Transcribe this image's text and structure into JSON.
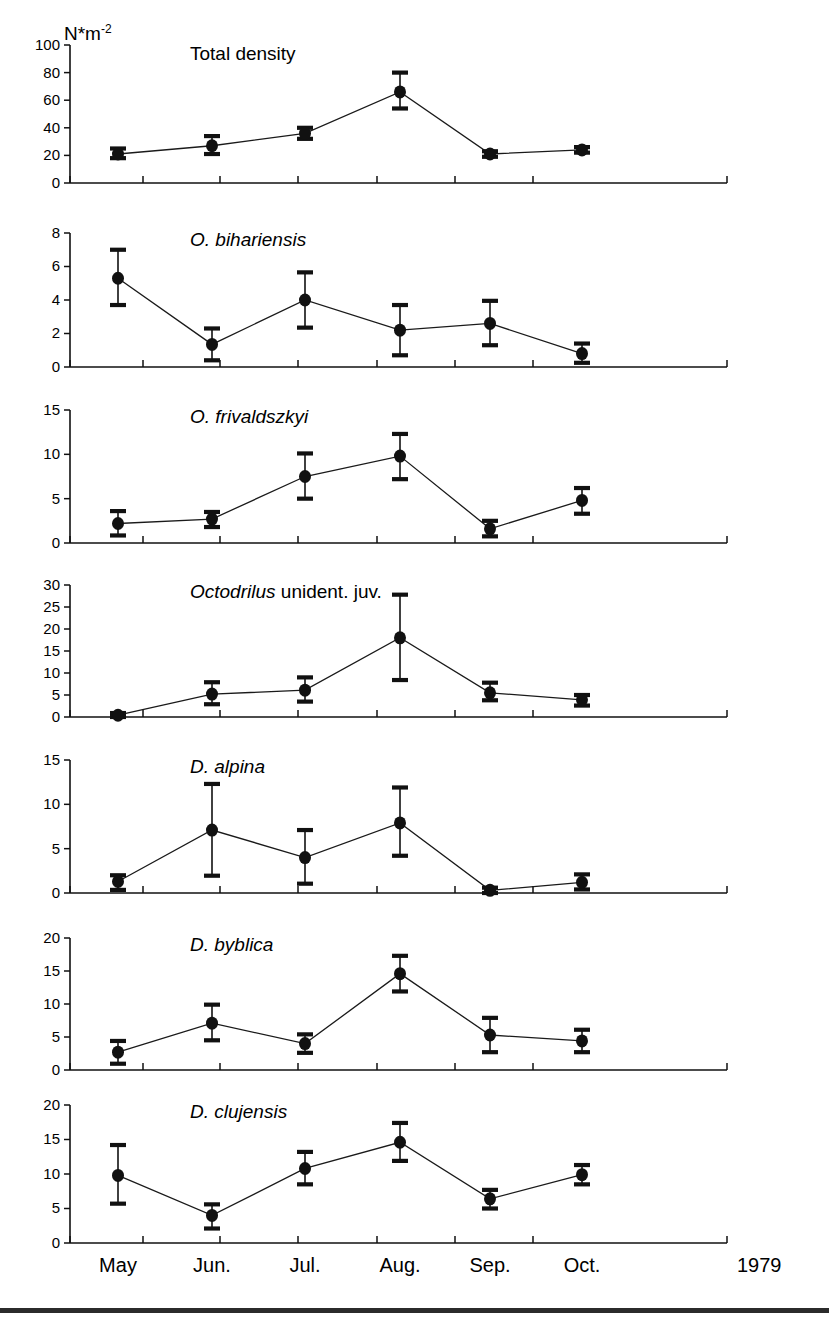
{
  "figure": {
    "unit_label": "N*m",
    "unit_exponent": "-2",
    "year": "1979",
    "x_categories": [
      "May",
      "Jun.",
      "Jul.",
      "Aug.",
      "Sep.",
      "Oct."
    ]
  },
  "chart_data": {
    "type": "line",
    "title": "",
    "xlabel": "",
    "ylabel": "N*m-2",
    "grid": false,
    "legend": "none",
    "x": [
      "May",
      "Jun.",
      "Jul.",
      "Aug.",
      "Sep.",
      "Oct."
    ],
    "panels": [
      {
        "title": "Total density",
        "title_italic": "",
        "title_plain": "Total density",
        "ylim": [
          0,
          100
        ],
        "yticks": [
          0,
          20,
          40,
          60,
          80,
          100
        ],
        "values": [
          21,
          27,
          36,
          66,
          21,
          24
        ],
        "err_low": [
          18,
          21,
          32,
          54,
          19,
          22
        ],
        "err_high": [
          25,
          34,
          40,
          80,
          23,
          26
        ]
      },
      {
        "title": "O. bihariensis",
        "title_italic": "O. bihariensis",
        "title_plain": "",
        "ylim": [
          0,
          8
        ],
        "yticks": [
          0,
          2,
          4,
          6,
          8
        ],
        "values": [
          5.3,
          1.35,
          4.0,
          2.2,
          2.6,
          0.8
        ],
        "err_low": [
          3.7,
          0.4,
          2.35,
          0.7,
          1.3,
          0.25
        ],
        "err_high": [
          7.0,
          2.3,
          5.65,
          3.7,
          3.95,
          1.4
        ]
      },
      {
        "title": "O. frivaldszkyi",
        "title_italic": "O. frivaldszkyi",
        "title_plain": "",
        "ylim": [
          0,
          15
        ],
        "yticks": [
          0,
          5,
          10,
          15
        ],
        "values": [
          2.2,
          2.7,
          7.5,
          9.8,
          1.6,
          4.8
        ],
        "err_low": [
          0.85,
          1.8,
          5.0,
          7.2,
          0.75,
          3.3
        ],
        "err_high": [
          3.6,
          3.5,
          10.1,
          12.3,
          2.5,
          6.2
        ]
      },
      {
        "title": "Octodrilus unident. juv.",
        "title_italic": "Octodrilus",
        "title_plain": " unident. juv.",
        "ylim": [
          0,
          30
        ],
        "yticks": [
          0,
          5,
          10,
          15,
          20,
          25,
          30
        ],
        "values": [
          0.4,
          5.2,
          6.1,
          18.0,
          5.5,
          3.9
        ],
        "err_low": [
          0.0,
          2.9,
          3.5,
          8.4,
          3.8,
          2.6
        ],
        "err_high": [
          0.9,
          7.9,
          9.0,
          27.8,
          7.8,
          5.0
        ]
      },
      {
        "title": "D. alpina",
        "title_italic": "D. alpina",
        "title_plain": "",
        "ylim": [
          0,
          15
        ],
        "yticks": [
          0,
          5,
          10,
          15
        ],
        "values": [
          1.3,
          7.1,
          4.0,
          7.9,
          0.3,
          1.2
        ],
        "err_low": [
          0.35,
          1.95,
          1.05,
          4.2,
          0.0,
          0.4
        ],
        "err_high": [
          2.0,
          12.3,
          7.1,
          11.9,
          0.6,
          2.1
        ]
      },
      {
        "title": "D. byblica",
        "title_italic": "D. byblica",
        "title_plain": "",
        "ylim": [
          0,
          20
        ],
        "yticks": [
          0,
          5,
          10,
          15,
          20
        ],
        "values": [
          2.7,
          7.1,
          4.0,
          14.6,
          5.3,
          4.4
        ],
        "err_low": [
          0.95,
          4.5,
          2.6,
          11.9,
          2.7,
          2.7
        ],
        "err_high": [
          4.4,
          9.9,
          5.4,
          17.3,
          7.9,
          6.1
        ]
      },
      {
        "title": "D. clujensis",
        "title_italic": "D. clujensis",
        "title_plain": "",
        "ylim": [
          0,
          20
        ],
        "yticks": [
          0,
          5,
          10,
          15,
          20
        ],
        "values": [
          9.8,
          4.0,
          10.8,
          14.6,
          6.4,
          9.9
        ],
        "err_low": [
          5.7,
          2.1,
          8.5,
          11.9,
          5.0,
          8.5
        ],
        "err_high": [
          14.2,
          5.6,
          13.2,
          17.4,
          7.7,
          11.3
        ]
      }
    ]
  }
}
